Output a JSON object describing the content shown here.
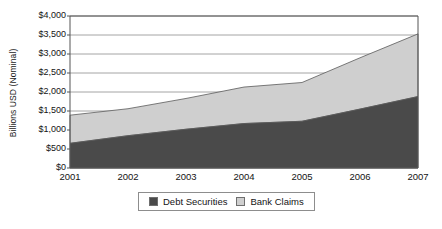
{
  "chart_data": {
    "type": "area",
    "stacked": true,
    "title": "",
    "xlabel": "",
    "ylabel": "Billions USD (Nominal)",
    "categories": [
      "2001",
      "2002",
      "2003",
      "2004",
      "2005",
      "2006",
      "2007"
    ],
    "x": [
      2001,
      2002,
      2003,
      2004,
      2005,
      2006,
      2007
    ],
    "series": [
      {
        "name": "Debt Securities",
        "color": "#4a4a4a",
        "values": [
          650,
          850,
          1020,
          1170,
          1230,
          1550,
          1880
        ]
      },
      {
        "name": "Bank Claims",
        "color": "#cfcfcf",
        "values": [
          740,
          710,
          810,
          960,
          1020,
          1350,
          1650
        ]
      }
    ],
    "cumulative_totals": [
      1390,
      1560,
      1830,
      2130,
      2250,
      2900,
      3530
    ],
    "ylim": [
      0,
      4000
    ],
    "ytick_values": [
      0,
      500,
      1000,
      1500,
      2000,
      2500,
      3000,
      3500,
      4000
    ],
    "ytick_labels": [
      "$0",
      "$500",
      "$1,000",
      "$1,500",
      "$2,000",
      "$2,500",
      "$3,000",
      "$3,500",
      "$4,000"
    ],
    "grid": true,
    "grid_axis": "y",
    "legend_position": "bottom"
  },
  "legend": {
    "entries": [
      {
        "label": "Debt Securities",
        "color": "#4a4a4a"
      },
      {
        "label": "Bank Claims",
        "color": "#cfcfcf"
      }
    ]
  },
  "colors": {
    "debt_securities": "#4a4a4a",
    "bank_claims": "#cfcfcf",
    "gridline": "#8d8d8d",
    "axis": "#555555",
    "plot_background": "#ffffff"
  }
}
